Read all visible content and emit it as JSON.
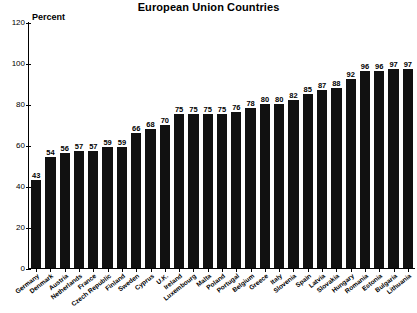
{
  "chart_data": {
    "type": "bar",
    "title": "European Union Countries",
    "xlabel": "",
    "ylabel": "Percent",
    "ylim": [
      0,
      120
    ],
    "yticks": [
      0,
      20,
      40,
      60,
      80,
      100,
      120
    ],
    "grid": false,
    "legend": null,
    "categories": [
      "Germany",
      "Denmark",
      "Austria",
      "Netherlands",
      "France",
      "Czech Republic",
      "Finland",
      "Sweden",
      "Cyprus",
      "U.K.",
      "Ireland",
      "Luxembourg",
      "Malta",
      "Poland",
      "Portugal",
      "Belgium",
      "Greece",
      "Italy",
      "Slovenia",
      "Spain",
      "Latvia",
      "Slovakia",
      "Hungary",
      "Romania",
      "Estonia",
      "Bulgaria",
      "Lithuania"
    ],
    "values": [
      43,
      54,
      56,
      57,
      57,
      59,
      59,
      66,
      68,
      70,
      75,
      75,
      75,
      75,
      76,
      78,
      80,
      80,
      82,
      85,
      87,
      88,
      92,
      96,
      96,
      97,
      97
    ]
  }
}
